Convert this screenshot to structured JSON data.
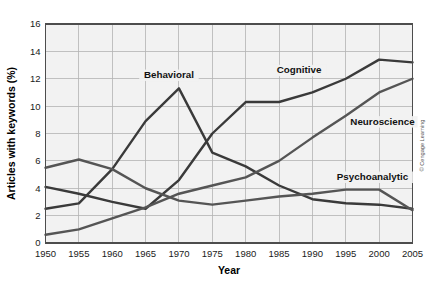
{
  "figure": {
    "credit": "© Cengage Learning"
  },
  "chart_data": {
    "type": "line",
    "title": "",
    "xlabel": "Year",
    "ylabel": "Articles with keywords (%)",
    "x": [
      1950,
      1955,
      1960,
      1965,
      1970,
      1975,
      1980,
      1985,
      1990,
      1995,
      2000,
      2005
    ],
    "xtick_labels": [
      "1950",
      "1955",
      "1960",
      "1965",
      "1970",
      "1975",
      "1980",
      "1985",
      "1990",
      "1995",
      "2000",
      "2005"
    ],
    "ytick_labels": [
      "0",
      "2",
      "4",
      "6",
      "8",
      "10",
      "12",
      "14",
      "16"
    ],
    "yticks": [
      0,
      2,
      4,
      6,
      8,
      10,
      12,
      14,
      16
    ],
    "xlim": [
      1950,
      2005
    ],
    "ylim": [
      0,
      16
    ],
    "grid": true,
    "legend_position": "inline-labels",
    "series": [
      {
        "name": "Behavioral",
        "color": "#3a3a3a",
        "values": [
          2.5,
          2.9,
          5.4,
          8.9,
          11.3,
          6.6,
          5.6,
          4.2,
          3.2,
          2.9,
          2.8,
          2.5
        ],
        "label": "Behavioral",
        "label_x": 1968.5,
        "label_y": 12.05
      },
      {
        "name": "Cognitive",
        "color": "#3a3a3a",
        "values": [
          4.1,
          3.6,
          3.0,
          2.5,
          4.6,
          8.0,
          10.3,
          10.3,
          11.0,
          12.0,
          13.4,
          13.2
        ],
        "label": "Cognitive",
        "label_x": 1988.0,
        "label_y": 12.4
      },
      {
        "name": "Neuroscience",
        "color": "#555555",
        "values": [
          0.6,
          1.0,
          1.8,
          2.6,
          3.6,
          4.2,
          4.8,
          6.0,
          7.7,
          9.3,
          11.0,
          12.0
        ],
        "label": "Neuroscience",
        "label_x": 2000.5,
        "label_y": 8.65
      },
      {
        "name": "Psychoanalytic",
        "color": "#555555",
        "values": [
          5.5,
          6.1,
          5.4,
          4.0,
          3.1,
          2.8,
          3.1,
          3.4,
          3.6,
          3.9,
          3.9,
          2.4
        ],
        "label": "Psychoanalytic",
        "label_x": 1999.0,
        "label_y": 4.6
      }
    ]
  }
}
